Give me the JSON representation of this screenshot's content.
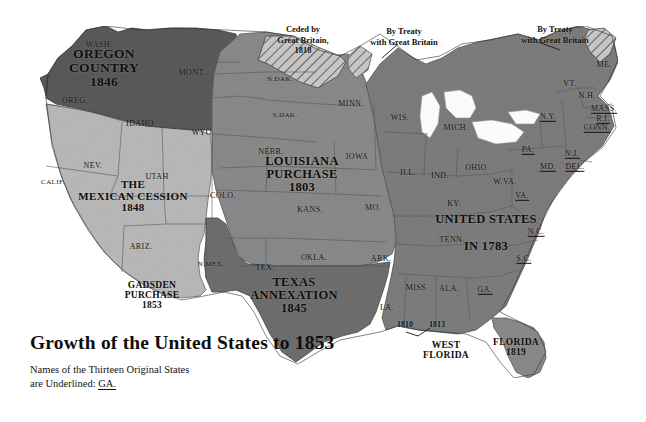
{
  "figure": {
    "title": "Growth of the United States to 1853",
    "subtitle_line1": "Names of the Thirteen Original States",
    "subtitle_line2_prefix": "are Underlined:",
    "subtitle_example": "GA.",
    "background_color": "#ffffff"
  },
  "palette": {
    "oregon_country": "#5a5a5a",
    "louisiana_purchase": "#8a8a8a",
    "mexican_cession": "#b9b9b9",
    "texas_annexation": "#6e6e6e",
    "united_states_1783": "#7d7d7d",
    "florida": "#8a8a8a",
    "ocean": "#ffffff",
    "text": "#15120f",
    "border": "#4a4744"
  },
  "territories": [
    {
      "name": "oregon-country",
      "line1": "OREGON",
      "line2": "COUNTRY",
      "year": "1846",
      "x": 104,
      "y": 68
    },
    {
      "name": "mexican-cession",
      "line1": "THE",
      "line2": "MEXICAN CESSION",
      "year": "1848",
      "x": 133,
      "y": 196
    },
    {
      "name": "gadsden-purchase",
      "line1": "GADSDEN",
      "line2": "PURCHASE",
      "year": "1853",
      "x": 152,
      "y": 296
    },
    {
      "name": "louisiana-purchase",
      "line1": "LOUISIANA",
      "line2": "PURCHASE",
      "year": "1803",
      "x": 302,
      "y": 175
    },
    {
      "name": "texas-annexation",
      "line1": "TEXAS",
      "line2": "ANNEXATION",
      "year": "1845",
      "x": 294,
      "y": 296
    },
    {
      "name": "united-states-1783",
      "line1": "UNITED STATES",
      "line2": "IN 1783",
      "year": "",
      "x": 486,
      "y": 233
    },
    {
      "name": "florida",
      "line1": "FLORIDA",
      "line2": "",
      "year": "1819",
      "x": 516,
      "y": 348
    },
    {
      "name": "west-florida",
      "line1": "WEST",
      "line2": "FLORIDA",
      "year": "",
      "x": 446,
      "y": 351
    }
  ],
  "annotations": [
    {
      "name": "ceded-by-great-britain",
      "line1": "Ceded by",
      "line2": "Great Britain,",
      "year": "1818",
      "x": 303,
      "y": 24
    },
    {
      "name": "by-treaty-with-great-britain-north",
      "line1": "By Treaty",
      "line2": "with Great Britain",
      "year": "",
      "x": 404,
      "y": 26
    },
    {
      "name": "by-treaty-with-great-britain-maine",
      "line1": "By Treaty",
      "line2": "with Great Britain",
      "year": "",
      "x": 555,
      "y": 24
    }
  ],
  "gulf_dates": [
    {
      "name": "date-1810",
      "value": "1810",
      "x": 405,
      "y": 325
    },
    {
      "name": "date-1813",
      "value": "1813",
      "x": 437,
      "y": 325
    }
  ],
  "states": [
    {
      "label": "WASH.",
      "x": 99,
      "y": 45,
      "original": false
    },
    {
      "label": "OREG.",
      "x": 75,
      "y": 101,
      "original": false
    },
    {
      "label": "IDAHO",
      "x": 140,
      "y": 124,
      "original": false
    },
    {
      "label": "MONT.",
      "x": 192,
      "y": 73,
      "original": false
    },
    {
      "label": "WYO.",
      "x": 203,
      "y": 133,
      "original": false
    },
    {
      "label": "NEV.",
      "x": 93,
      "y": 166,
      "original": false
    },
    {
      "label": "CALIF.",
      "x": 53,
      "y": 183,
      "original": false
    },
    {
      "label": "UTAH",
      "x": 157,
      "y": 177,
      "original": false
    },
    {
      "label": "ARIZ.",
      "x": 141,
      "y": 247,
      "original": false
    },
    {
      "label": "N.MEX.",
      "x": 211,
      "y": 265,
      "original": false
    },
    {
      "label": "COLO.",
      "x": 223,
      "y": 196,
      "original": false
    },
    {
      "label": "N.DAK.",
      "x": 280,
      "y": 80,
      "original": false
    },
    {
      "label": "S.DAK.",
      "x": 285,
      "y": 116,
      "original": false
    },
    {
      "label": "NEBR.",
      "x": 271,
      "y": 152,
      "original": false
    },
    {
      "label": "KANS.",
      "x": 310,
      "y": 210,
      "original": false
    },
    {
      "label": "OKLA.",
      "x": 314,
      "y": 258,
      "original": false
    },
    {
      "label": "TEX.",
      "x": 265,
      "y": 268,
      "original": false
    },
    {
      "label": "MINN.",
      "x": 351,
      "y": 104,
      "original": false
    },
    {
      "label": "IOWA",
      "x": 357,
      "y": 157,
      "original": false
    },
    {
      "label": "MO.",
      "x": 373,
      "y": 208,
      "original": false
    },
    {
      "label": "ARK.",
      "x": 381,
      "y": 259,
      "original": false
    },
    {
      "label": "LA.",
      "x": 387,
      "y": 308,
      "original": false
    },
    {
      "label": "WIS.",
      "x": 400,
      "y": 118,
      "original": false
    },
    {
      "label": "ILL.",
      "x": 408,
      "y": 173,
      "original": false
    },
    {
      "label": "IND.",
      "x": 440,
      "y": 176,
      "original": false
    },
    {
      "label": "MICH.",
      "x": 456,
      "y": 128,
      "original": false
    },
    {
      "label": "OHIO",
      "x": 476,
      "y": 168,
      "original": false
    },
    {
      "label": "KY.",
      "x": 454,
      "y": 204,
      "original": false
    },
    {
      "label": "TENN.",
      "x": 452,
      "y": 240,
      "original": false
    },
    {
      "label": "MISS.",
      "x": 417,
      "y": 288,
      "original": false
    },
    {
      "label": "ALA.",
      "x": 449,
      "y": 289,
      "original": false
    },
    {
      "label": "W.VA.",
      "x": 505,
      "y": 182,
      "original": false
    },
    {
      "label": "VT.",
      "x": 570,
      "y": 84,
      "original": false
    },
    {
      "label": "ME.",
      "x": 604,
      "y": 65,
      "original": false
    },
    {
      "label": "N.H.",
      "x": 587,
      "y": 96,
      "original": false
    },
    {
      "label": "MASS.",
      "x": 604,
      "y": 109,
      "original": true
    },
    {
      "label": "R.I.",
      "x": 603,
      "y": 119,
      "original": true
    },
    {
      "label": "CONN.",
      "x": 597,
      "y": 128,
      "original": true
    },
    {
      "label": "N.Y.",
      "x": 548,
      "y": 117,
      "original": true
    },
    {
      "label": "PA.",
      "x": 528,
      "y": 150,
      "original": true
    },
    {
      "label": "N.J.",
      "x": 572,
      "y": 154,
      "original": true
    },
    {
      "label": "MD.",
      "x": 548,
      "y": 167,
      "original": true
    },
    {
      "label": "DEL.",
      "x": 575,
      "y": 167,
      "original": true
    },
    {
      "label": "VA.",
      "x": 522,
      "y": 196,
      "original": true
    },
    {
      "label": "N.C.",
      "x": 536,
      "y": 232,
      "original": true
    },
    {
      "label": "S.C.",
      "x": 524,
      "y": 259,
      "original": true
    },
    {
      "label": "GA.",
      "x": 485,
      "y": 290,
      "original": true
    }
  ]
}
